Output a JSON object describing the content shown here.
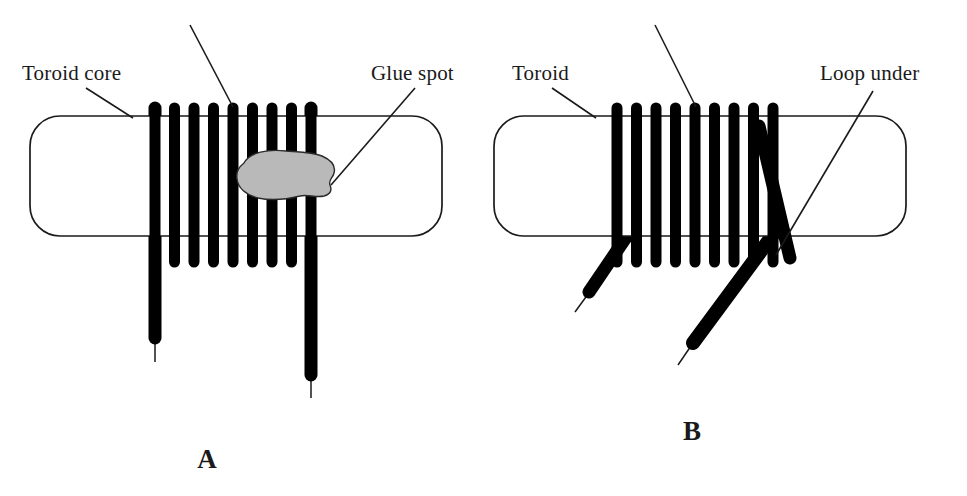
{
  "figure": {
    "background_color": "#ffffff",
    "ink_color": "#000000",
    "glue_color": "#b9b9b9"
  },
  "panels": [
    {
      "id": "A",
      "letter": "A",
      "letter_x": 207,
      "letter_y": 468,
      "core": {
        "name": "Toroid core",
        "x": 30,
        "y": 116,
        "width": 412,
        "height": 120,
        "corner_radius": 30
      },
      "winding": {
        "turns": 9,
        "first_x": 155,
        "spacing": 19.5,
        "bar_width": 10,
        "top_y": 108,
        "bottom_y": 262
      },
      "leads": [
        {
          "name": "start-lead",
          "x": 155,
          "from_y": 108,
          "to_y": 338,
          "tail_to_y": 362
        },
        {
          "name": "finish-lead",
          "x": 311,
          "from_y": 108,
          "to_y": 375,
          "tail_to_y": 398
        }
      ],
      "glue_spot": {
        "name": "Glue spot",
        "center_x": 283,
        "center_y": 176
      },
      "callouts": [
        {
          "label": "Toroid core",
          "text_x": 22,
          "text_y": 80,
          "anchor": "start",
          "line": "M 86 88 L 133 118"
        },
        {
          "label": "",
          "text_x": 0,
          "text_y": 0,
          "anchor": "start",
          "line": "M 190 25 L 233 107"
        },
        {
          "label": "Glue spot",
          "text_x": 371,
          "text_y": 80,
          "anchor": "start",
          "line": "M 415 88 L 331 185"
        }
      ]
    },
    {
      "id": "B",
      "letter": "B",
      "letter_x": 692,
      "letter_y": 440,
      "core": {
        "name": "Toroid",
        "x": 494,
        "y": 116,
        "width": 412,
        "height": 120,
        "corner_radius": 30
      },
      "winding": {
        "turns": 9,
        "first_x": 617,
        "spacing": 19.5,
        "bar_width": 10,
        "top_y": 108,
        "bottom_y": 262
      },
      "leads": [
        {
          "name": "start-lead",
          "from_x": 627,
          "from_y": 238,
          "to_x": 589,
          "to_y": 292,
          "tail_to_x": 575,
          "tail_to_y": 312
        },
        {
          "name": "finish-lead",
          "from_x": 771,
          "from_y": 238,
          "to_x": 693,
          "to_y": 343,
          "tail_to_x": 678,
          "tail_to_y": 365
        }
      ],
      "loop_under": {
        "name": "Loop under",
        "from_x": 761,
        "from_y": 128,
        "to_x": 793,
        "to_y": 255
      },
      "callouts": [
        {
          "label": "Toroid",
          "text_x": 512,
          "text_y": 80,
          "anchor": "start",
          "line": "M 552 88 L 596 118"
        },
        {
          "label": "",
          "text_x": 0,
          "text_y": 0,
          "anchor": "start",
          "line": "M 655 25 L 696 107"
        },
        {
          "label": "Loop under",
          "text_x": 820,
          "text_y": 80,
          "anchor": "start",
          "line": "M 873 91 L 776 255"
        }
      ]
    }
  ]
}
